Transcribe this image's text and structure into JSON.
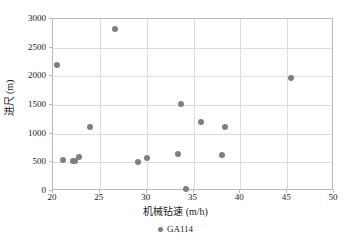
{
  "chart_data": {
    "type": "scatter",
    "title": "",
    "xlabel": "机械钻速 (m/h)",
    "ylabel": "进尺 (m)",
    "xlim": [
      20,
      50
    ],
    "ylim": [
      0,
      3000
    ],
    "xticks": [
      20,
      25,
      30,
      35,
      40,
      45,
      50
    ],
    "yticks": [
      0,
      500,
      1000,
      1500,
      2000,
      2500,
      3000
    ],
    "xtick_labels": [
      "20",
      "25",
      "30",
      "35",
      "40",
      "45",
      "50"
    ],
    "ytick_labels": [
      "0",
      "500",
      "1000",
      "1500",
      "2000",
      "2500",
      "3000"
    ],
    "grid": true,
    "legend_position": "below-axis-center",
    "marker_color": "#7f7f7f",
    "grid_color": "#dddddd",
    "axis_color": "#b9b9b9",
    "series": [
      {
        "name": "GA114",
        "marker": "circle",
        "color": "#7f7f7f",
        "points": [
          {
            "x": 20.4,
            "y": 2200
          },
          {
            "x": 21.1,
            "y": 545
          },
          {
            "x": 22.1,
            "y": 520
          },
          {
            "x": 22.4,
            "y": 530
          },
          {
            "x": 22.8,
            "y": 585
          },
          {
            "x": 23.9,
            "y": 1110
          },
          {
            "x": 26.6,
            "y": 2830
          },
          {
            "x": 29.1,
            "y": 510
          },
          {
            "x": 30.0,
            "y": 575
          },
          {
            "x": 33.3,
            "y": 640
          },
          {
            "x": 33.7,
            "y": 1510
          },
          {
            "x": 34.2,
            "y": 30
          },
          {
            "x": 35.8,
            "y": 1205
          },
          {
            "x": 38.0,
            "y": 620
          },
          {
            "x": 38.4,
            "y": 1110
          },
          {
            "x": 45.4,
            "y": 1970
          }
        ]
      }
    ]
  },
  "legend": {
    "label": "GA114"
  }
}
